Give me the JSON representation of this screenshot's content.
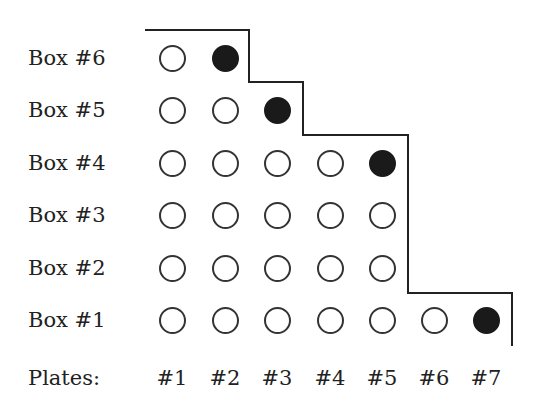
{
  "diagram": {
    "rows": [
      {
        "label": "Box #6",
        "count": 2,
        "filled_index": 2
      },
      {
        "label": "Box #5",
        "count": 3,
        "filled_index": 3
      },
      {
        "label": "Box #4",
        "count": 5,
        "filled_index": 5
      },
      {
        "label": "Box #3",
        "count": 5,
        "filled_index": null
      },
      {
        "label": "Box #2",
        "count": 5,
        "filled_index": null
      },
      {
        "label": "Box #1",
        "count": 7,
        "filled_index": 7
      }
    ],
    "plates_label": "Plates:",
    "plates": [
      "#1",
      "#2",
      "#3",
      "#4",
      "#5",
      "#6",
      "#7"
    ],
    "colors": {
      "line": "#222222",
      "filled": "#1a1a1a",
      "empty_stroke": "#333333"
    }
  }
}
